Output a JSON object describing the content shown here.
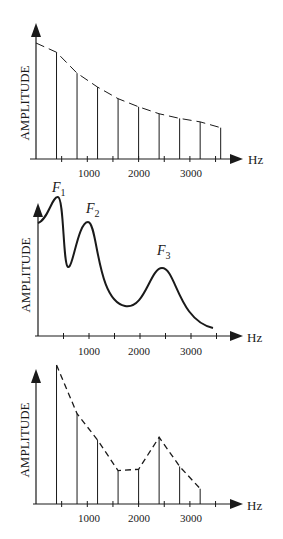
{
  "chart_data": [
    {
      "type": "bar",
      "title": "Harmonic spectrum (source)",
      "xlabel": "Hz",
      "ylabel": "AMPLITUDE",
      "x_tick_labels": [
        "1000",
        "2000",
        "3000"
      ],
      "x_ticks": [
        1000,
        2000,
        3000
      ],
      "xlim": [
        0,
        3800
      ],
      "categories": [
        400,
        800,
        1200,
        1600,
        2000,
        2400,
        2800,
        3200,
        3600
      ],
      "values": [
        92,
        74,
        62,
        52,
        45,
        39,
        35,
        32,
        27
      ],
      "envelope": "dashed decaying curve",
      "grid": false,
      "legend": null
    },
    {
      "type": "line",
      "title": "Vocal tract filter function",
      "xlabel": "Hz",
      "ylabel": "AMPLITUDE",
      "x_tick_labels": [
        "1000",
        "2000",
        "3000"
      ],
      "x_ticks": [
        1000,
        2000,
        3000
      ],
      "xlim": [
        0,
        3800
      ],
      "x": [
        0,
        200,
        400,
        600,
        800,
        1000,
        1200,
        1500,
        1800,
        2100,
        2300,
        2500,
        2700,
        3000,
        3400
      ],
      "values": [
        82,
        92,
        100,
        50,
        80,
        90,
        60,
        40,
        22,
        28,
        50,
        63,
        48,
        20,
        5
      ],
      "annotations": [
        {
          "label": "F1",
          "sub": "1",
          "x": 400
        },
        {
          "label": "F2",
          "sub": "2",
          "x": 1000
        },
        {
          "label": "F3",
          "sub": "3",
          "x": 2500
        }
      ],
      "grid": false,
      "legend": null
    },
    {
      "type": "bar",
      "title": "Output spectrum",
      "xlabel": "Hz",
      "ylabel": "AMPLITUDE",
      "x_tick_labels": [
        "1000",
        "2000",
        "3000"
      ],
      "x_ticks": [
        1000,
        2000,
        3000
      ],
      "xlim": [
        0,
        3800
      ],
      "categories": [
        400,
        800,
        1200,
        1600,
        2000,
        2400,
        2800,
        3200
      ],
      "values": [
        100,
        65,
        46,
        24,
        25,
        48,
        27,
        11
      ],
      "envelope": "dashed line connecting bar tops",
      "grid": false,
      "legend": null
    }
  ],
  "labels": {
    "ylabel": "AMPLITUDE",
    "xunit": "Hz",
    "ticks": [
      "1000",
      "2000",
      "3000"
    ],
    "f1": "F",
    "f1_sub": "1",
    "f2": "F",
    "f2_sub": "2",
    "f3": "F",
    "f3_sub": "3"
  },
  "colors": {
    "ink": "#1a1a1a",
    "background": "#ffffff"
  }
}
